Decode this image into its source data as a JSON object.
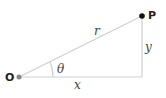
{
  "diagram": {
    "title": "",
    "points": {
      "origin": {
        "label": "O",
        "x": 19,
        "y": 77,
        "color": "#888888"
      },
      "p": {
        "label": "P",
        "x": 142,
        "y": 16,
        "color": "#111111"
      },
      "corner": {
        "x": 142,
        "y": 77
      }
    },
    "segments": {
      "hypotenuse": {
        "label": "r"
      },
      "horizontal": {
        "label": "x"
      },
      "vertical": {
        "label": "y"
      }
    },
    "angle": {
      "label": "θ"
    },
    "colors": {
      "line": "#cfcfcf",
      "text": "#333333"
    }
  }
}
